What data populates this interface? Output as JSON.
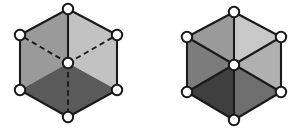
{
  "figure": {
    "background_color": "#ffffff",
    "edge_color": "#1a1a1a",
    "vertex_fill": "#ffffff",
    "vertex_radius": 5.2,
    "canvas": {
      "width": 301,
      "height": 134
    }
  },
  "left_figure": {
    "name": "hexagon-with-hidden-edges",
    "description": "Hexagon drawn as a cube projection: three rhombic faces meeting at the centre, with the three edges from the centre drawn dashed as hidden lines.",
    "center": {
      "x": 68,
      "y": 63
    },
    "vertices": [
      {
        "id": "top",
        "x": 68,
        "y": 9
      },
      {
        "id": "upper-right",
        "x": 117,
        "y": 35
      },
      {
        "id": "lower-right",
        "x": 117,
        "y": 90
      },
      {
        "id": "bottom",
        "x": 68,
        "y": 117
      },
      {
        "id": "lower-left",
        "x": 20,
        "y": 90
      },
      {
        "id": "upper-left",
        "x": 20,
        "y": 35
      },
      {
        "id": "center",
        "x": 68,
        "y": 63
      }
    ],
    "faces": [
      {
        "id": "top-left-rhombus",
        "color": "#9a9a9a",
        "points": "68,9 20,35 68,63"
      },
      {
        "id": "left-rhombus",
        "color": "#9a9a9a",
        "points": "20,35 20,90 68,63"
      },
      {
        "id": "top-right-rhombus",
        "color": "#c2c2c2",
        "points": "68,9 117,35 68,63"
      },
      {
        "id": "right-rhombus",
        "color": "#c2c2c2",
        "points": "117,35 117,90 68,63"
      },
      {
        "id": "bottom-left-rhombus",
        "color": "#5a5a5a",
        "points": "20,90 68,117 68,63"
      },
      {
        "id": "bottom-right-rhombus",
        "color": "#5a5a5a",
        "points": "68,117 117,90 68,63"
      }
    ],
    "solid_edges": [
      "68,9 117,35",
      "117,35 117,90",
      "117,90 68,117",
      "68,117 20,90",
      "20,90 20,35",
      "20,35 68,9",
      "68,9 68,63"
    ],
    "dashed_edges": [
      "68,63 20,35",
      "68,63 117,35",
      "68,63 68,117"
    ]
  },
  "right_figure": {
    "name": "hexagon-six-triangles",
    "description": "Hexagon divided into six triangular faces by three solid diagonals through the centre; each triangle carries a different grey tone.",
    "center": {
      "x": 234,
      "y": 65
    },
    "vertices": [
      {
        "id": "top",
        "x": 234,
        "y": 12
      },
      {
        "id": "upper-right",
        "x": 281,
        "y": 37
      },
      {
        "id": "lower-right",
        "x": 281,
        "y": 92
      },
      {
        "id": "bottom",
        "x": 234,
        "y": 120
      },
      {
        "id": "lower-left",
        "x": 187,
        "y": 92
      },
      {
        "id": "upper-left",
        "x": 187,
        "y": 37
      },
      {
        "id": "center",
        "x": 234,
        "y": 65
      }
    ],
    "faces": [
      {
        "id": "triangle-top-left",
        "color": "#9a9a9a",
        "points": "234,12 187,37 234,65"
      },
      {
        "id": "triangle-top-right",
        "color": "#c8c8c8",
        "points": "234,12 281,37 234,65"
      },
      {
        "id": "triangle-left",
        "color": "#7c7c7c",
        "points": "187,37 187,92 234,65"
      },
      {
        "id": "triangle-right",
        "color": "#b0b0b0",
        "points": "281,37 281,92 234,65"
      },
      {
        "id": "triangle-bottom-left",
        "color": "#3f3f3f",
        "points": "187,92 234,120 234,65"
      },
      {
        "id": "triangle-bottom-right",
        "color": "#6e6e6e",
        "points": "234,120 281,92 234,65"
      }
    ],
    "solid_edges": [
      "234,12 281,37",
      "281,37 281,92",
      "281,92 234,120",
      "234,120 187,92",
      "187,92 187,37",
      "187,37 234,12",
      "234,12 234,120",
      "187,37 281,92",
      "281,37 187,92"
    ],
    "dashed_edges": []
  }
}
